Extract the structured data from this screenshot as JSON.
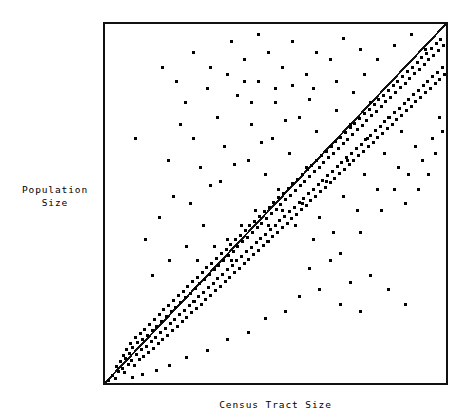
{
  "chart_data": {
    "type": "scatter",
    "title": "",
    "xlabel": "Census Tract Size",
    "ylabel": "Population\nSize",
    "grid": false,
    "legend": null,
    "axis_ticks": {
      "x": [],
      "y": []
    },
    "xlim": [
      0,
      100
    ],
    "ylim": [
      0,
      100
    ],
    "reference_line": {
      "name": "identity-line",
      "from": [
        0,
        0
      ],
      "to": [
        100,
        100
      ],
      "style": "solid",
      "color": "#111111",
      "width_px": 2
    },
    "marker": {
      "shape": "square",
      "size_px": 3,
      "color": "#000000"
    },
    "n_points": 466,
    "points": [
      [
        1.0,
        0.6
      ],
      [
        2.3,
        2.0
      ],
      [
        3.1,
        1.2
      ],
      [
        3.4,
        4.6
      ],
      [
        4.0,
        3.2
      ],
      [
        4.6,
        6.0
      ],
      [
        5.0,
        4.1
      ],
      [
        5.3,
        7.7
      ],
      [
        5.8,
        3.0
      ],
      [
        6.1,
        6.9
      ],
      [
        6.4,
        9.4
      ],
      [
        6.9,
        5.2
      ],
      [
        7.2,
        8.1
      ],
      [
        7.5,
        11.0
      ],
      [
        7.9,
        6.3
      ],
      [
        8.2,
        9.9
      ],
      [
        8.6,
        4.8
      ],
      [
        8.9,
        12.6
      ],
      [
        9.2,
        8.0
      ],
      [
        9.6,
        11.4
      ],
      [
        10.0,
        6.6
      ],
      [
        10.3,
        13.9
      ],
      [
        10.7,
        9.2
      ],
      [
        11.0,
        12.1
      ],
      [
        11.4,
        7.4
      ],
      [
        11.7,
        15.0
      ],
      [
        12.1,
        10.3
      ],
      [
        12.4,
        13.2
      ],
      [
        12.8,
        8.5
      ],
      [
        13.1,
        16.4
      ],
      [
        13.5,
        11.6
      ],
      [
        13.8,
        14.5
      ],
      [
        14.2,
        9.7
      ],
      [
        14.5,
        17.8
      ],
      [
        14.9,
        12.8
      ],
      [
        15.2,
        15.8
      ],
      [
        15.6,
        10.9
      ],
      [
        15.9,
        19.1
      ],
      [
        16.3,
        14.0
      ],
      [
        16.6,
        17.2
      ],
      [
        17.0,
        12.1
      ],
      [
        17.3,
        20.4
      ],
      [
        17.7,
        15.3
      ],
      [
        18.0,
        18.5
      ],
      [
        18.4,
        13.3
      ],
      [
        18.7,
        21.7
      ],
      [
        19.1,
        16.6
      ],
      [
        19.4,
        19.8
      ],
      [
        19.8,
        14.5
      ],
      [
        20.1,
        23.0
      ],
      [
        20.5,
        17.8
      ],
      [
        20.8,
        21.1
      ],
      [
        21.2,
        15.8
      ],
      [
        21.5,
        24.3
      ],
      [
        21.9,
        19.0
      ],
      [
        22.2,
        22.4
      ],
      [
        22.6,
        17.0
      ],
      [
        22.9,
        25.6
      ],
      [
        23.3,
        20.3
      ],
      [
        23.6,
        23.7
      ],
      [
        24.0,
        18.3
      ],
      [
        24.3,
        26.9
      ],
      [
        24.7,
        21.5
      ],
      [
        25.0,
        25.0
      ],
      [
        25.4,
        19.5
      ],
      [
        25.7,
        28.2
      ],
      [
        26.1,
        22.8
      ],
      [
        26.4,
        26.3
      ],
      [
        26.8,
        20.8
      ],
      [
        27.1,
        29.5
      ],
      [
        27.5,
        24.0
      ],
      [
        27.8,
        27.6
      ],
      [
        28.2,
        22.0
      ],
      [
        28.5,
        30.8
      ],
      [
        28.9,
        25.3
      ],
      [
        29.2,
        28.9
      ],
      [
        29.6,
        23.3
      ],
      [
        29.9,
        32.1
      ],
      [
        30.3,
        26.5
      ],
      [
        30.6,
        30.2
      ],
      [
        31.0,
        24.5
      ],
      [
        31.3,
        33.4
      ],
      [
        31.7,
        27.8
      ],
      [
        32.0,
        31.5
      ],
      [
        32.4,
        25.8
      ],
      [
        32.7,
        34.7
      ],
      [
        33.1,
        29.0
      ],
      [
        33.4,
        32.8
      ],
      [
        33.8,
        27.0
      ],
      [
        34.1,
        36.0
      ],
      [
        34.5,
        30.3
      ],
      [
        34.8,
        34.1
      ],
      [
        35.2,
        28.3
      ],
      [
        35.5,
        37.3
      ],
      [
        35.9,
        31.5
      ],
      [
        36.2,
        35.4
      ],
      [
        36.6,
        29.5
      ],
      [
        36.9,
        38.6
      ],
      [
        37.3,
        32.8
      ],
      [
        37.6,
        36.7
      ],
      [
        38.0,
        30.8
      ],
      [
        38.3,
        39.9
      ],
      [
        38.7,
        34.0
      ],
      [
        39.0,
        38.0
      ],
      [
        39.4,
        32.0
      ],
      [
        39.7,
        41.2
      ],
      [
        40.1,
        35.3
      ],
      [
        40.4,
        39.3
      ],
      [
        40.8,
        33.3
      ],
      [
        41.1,
        42.5
      ],
      [
        41.5,
        36.5
      ],
      [
        41.8,
        40.6
      ],
      [
        42.2,
        34.5
      ],
      [
        42.5,
        43.8
      ],
      [
        42.9,
        37.8
      ],
      [
        43.2,
        41.9
      ],
      [
        43.6,
        35.8
      ],
      [
        43.9,
        45.1
      ],
      [
        44.3,
        39.0
      ],
      [
        44.6,
        43.2
      ],
      [
        45.0,
        37.0
      ],
      [
        45.3,
        46.4
      ],
      [
        45.7,
        40.3
      ],
      [
        46.0,
        44.5
      ],
      [
        46.4,
        38.3
      ],
      [
        46.7,
        47.7
      ],
      [
        47.1,
        41.5
      ],
      [
        47.4,
        45.8
      ],
      [
        47.8,
        39.5
      ],
      [
        48.1,
        49.0
      ],
      [
        48.5,
        42.8
      ],
      [
        48.8,
        47.1
      ],
      [
        49.2,
        40.8
      ],
      [
        49.5,
        50.3
      ],
      [
        49.9,
        44.0
      ],
      [
        50.2,
        48.4
      ],
      [
        50.6,
        42.0
      ],
      [
        50.9,
        51.6
      ],
      [
        51.3,
        45.3
      ],
      [
        51.6,
        49.7
      ],
      [
        52.0,
        43.3
      ],
      [
        52.3,
        52.9
      ],
      [
        52.7,
        46.5
      ],
      [
        53.0,
        51.0
      ],
      [
        53.4,
        44.5
      ],
      [
        53.7,
        54.2
      ],
      [
        54.1,
        47.8
      ],
      [
        54.4,
        52.3
      ],
      [
        54.8,
        45.8
      ],
      [
        55.1,
        55.5
      ],
      [
        55.5,
        49.0
      ],
      [
        55.8,
        53.6
      ],
      [
        56.2,
        47.0
      ],
      [
        56.5,
        56.8
      ],
      [
        56.9,
        50.3
      ],
      [
        57.2,
        54.9
      ],
      [
        57.6,
        48.3
      ],
      [
        57.9,
        58.1
      ],
      [
        58.3,
        51.5
      ],
      [
        58.6,
        56.2
      ],
      [
        59.0,
        49.5
      ],
      [
        59.3,
        59.4
      ],
      [
        59.7,
        52.8
      ],
      [
        60.0,
        57.5
      ],
      [
        60.4,
        50.8
      ],
      [
        60.7,
        60.7
      ],
      [
        61.1,
        54.0
      ],
      [
        61.4,
        58.8
      ],
      [
        61.8,
        52.0
      ],
      [
        62.1,
        62.0
      ],
      [
        62.5,
        55.3
      ],
      [
        62.8,
        60.1
      ],
      [
        63.2,
        53.3
      ],
      [
        63.5,
        63.3
      ],
      [
        63.9,
        56.5
      ],
      [
        64.2,
        61.4
      ],
      [
        64.6,
        54.5
      ],
      [
        64.9,
        64.6
      ],
      [
        65.3,
        57.8
      ],
      [
        65.6,
        62.7
      ],
      [
        66.0,
        55.8
      ],
      [
        66.3,
        65.9
      ],
      [
        66.7,
        59.0
      ],
      [
        67.0,
        64.0
      ],
      [
        67.4,
        57.0
      ],
      [
        67.7,
        67.2
      ],
      [
        68.1,
        60.3
      ],
      [
        68.4,
        65.3
      ],
      [
        68.8,
        58.3
      ],
      [
        69.1,
        68.5
      ],
      [
        69.5,
        61.5
      ],
      [
        69.8,
        66.6
      ],
      [
        70.2,
        59.5
      ],
      [
        70.5,
        69.8
      ],
      [
        70.9,
        62.8
      ],
      [
        71.2,
        67.9
      ],
      [
        71.6,
        60.8
      ],
      [
        71.9,
        71.1
      ],
      [
        72.3,
        64.0
      ],
      [
        72.6,
        69.2
      ],
      [
        73.0,
        62.0
      ],
      [
        73.3,
        72.4
      ],
      [
        73.7,
        65.3
      ],
      [
        74.0,
        70.5
      ],
      [
        74.4,
        63.3
      ],
      [
        74.7,
        73.7
      ],
      [
        75.1,
        66.5
      ],
      [
        75.4,
        71.8
      ],
      [
        75.8,
        64.5
      ],
      [
        76.1,
        75.0
      ],
      [
        76.5,
        67.8
      ],
      [
        76.8,
        73.1
      ],
      [
        77.2,
        65.8
      ],
      [
        77.5,
        76.3
      ],
      [
        77.9,
        69.0
      ],
      [
        78.2,
        74.4
      ],
      [
        78.6,
        67.0
      ],
      [
        78.9,
        77.6
      ],
      [
        79.3,
        70.3
      ],
      [
        79.6,
        75.7
      ],
      [
        80.0,
        68.3
      ],
      [
        80.3,
        78.9
      ],
      [
        80.7,
        71.5
      ],
      [
        81.0,
        77.0
      ],
      [
        81.4,
        69.5
      ],
      [
        81.7,
        80.2
      ],
      [
        82.1,
        72.8
      ],
      [
        82.4,
        78.3
      ],
      [
        82.8,
        70.8
      ],
      [
        83.1,
        81.5
      ],
      [
        83.5,
        74.0
      ],
      [
        83.8,
        79.6
      ],
      [
        84.2,
        72.0
      ],
      [
        84.5,
        82.8
      ],
      [
        84.9,
        75.3
      ],
      [
        85.2,
        80.9
      ],
      [
        85.6,
        73.3
      ],
      [
        85.9,
        84.1
      ],
      [
        86.3,
        76.5
      ],
      [
        86.6,
        82.2
      ],
      [
        87.0,
        74.5
      ],
      [
        87.3,
        85.4
      ],
      [
        87.7,
        77.8
      ],
      [
        88.0,
        83.5
      ],
      [
        88.4,
        75.8
      ],
      [
        88.7,
        86.7
      ],
      [
        89.1,
        79.0
      ],
      [
        89.4,
        84.8
      ],
      [
        89.8,
        77.0
      ],
      [
        90.1,
        88.0
      ],
      [
        90.5,
        80.3
      ],
      [
        90.8,
        86.1
      ],
      [
        91.2,
        78.3
      ],
      [
        91.5,
        89.3
      ],
      [
        91.9,
        81.5
      ],
      [
        92.2,
        87.4
      ],
      [
        92.6,
        79.5
      ],
      [
        92.9,
        90.6
      ],
      [
        93.3,
        82.8
      ],
      [
        93.6,
        88.7
      ],
      [
        94.0,
        80.8
      ],
      [
        94.3,
        91.9
      ],
      [
        94.7,
        84.0
      ],
      [
        95.0,
        90.0
      ],
      [
        95.4,
        82.0
      ],
      [
        95.7,
        93.2
      ],
      [
        96.1,
        85.3
      ],
      [
        96.4,
        91.3
      ],
      [
        96.8,
        83.3
      ],
      [
        97.1,
        94.5
      ],
      [
        97.5,
        86.5
      ],
      [
        97.8,
        92.6
      ],
      [
        98.2,
        84.5
      ],
      [
        98.5,
        95.8
      ],
      [
        98.9,
        87.8
      ],
      [
        99.2,
        93.9
      ],
      [
        99.6,
        85.8
      ],
      [
        99.9,
        97.1
      ]
    ],
    "points_upper_scatter": [
      [
        22.0,
        72.0
      ],
      [
        23.5,
        78.0
      ],
      [
        30.0,
        82.0
      ],
      [
        36.0,
        86.0
      ],
      [
        41.0,
        90.0
      ],
      [
        18.5,
        62.0
      ],
      [
        26.0,
        68.0
      ],
      [
        33.0,
        74.0
      ],
      [
        39.0,
        80.0
      ],
      [
        45.0,
        84.0
      ],
      [
        28.0,
        60.0
      ],
      [
        35.0,
        66.0
      ],
      [
        43.0,
        72.0
      ],
      [
        50.0,
        78.0
      ],
      [
        55.0,
        83.0
      ],
      [
        31.0,
        55.0
      ],
      [
        38.0,
        61.0
      ],
      [
        46.0,
        67.0
      ],
      [
        53.0,
        73.0
      ],
      [
        60.0,
        79.0
      ],
      [
        25.0,
        50.0
      ],
      [
        34.0,
        56.0
      ],
      [
        42.0,
        62.0
      ],
      [
        49.0,
        68.0
      ],
      [
        57.0,
        74.0
      ],
      [
        47.0,
        58.0
      ],
      [
        54.0,
        64.0
      ],
      [
        62.0,
        70.0
      ],
      [
        68.0,
        76.0
      ],
      [
        73.0,
        81.0
      ],
      [
        51.0,
        54.0
      ],
      [
        59.0,
        60.0
      ],
      [
        66.0,
        66.0
      ],
      [
        72.0,
        72.0
      ],
      [
        78.0,
        78.0
      ],
      [
        58.0,
        50.0
      ],
      [
        65.0,
        56.0
      ],
      [
        71.0,
        62.0
      ],
      [
        77.0,
        68.0
      ],
      [
        83.0,
        74.0
      ],
      [
        63.0,
        46.0
      ],
      [
        70.0,
        52.0
      ],
      [
        76.0,
        58.0
      ],
      [
        82.0,
        64.0
      ],
      [
        87.0,
        70.0
      ],
      [
        67.0,
        42.0
      ],
      [
        74.0,
        48.0
      ],
      [
        80.0,
        54.0
      ],
      [
        86.0,
        60.0
      ],
      [
        91.0,
        66.0
      ],
      [
        44.0,
        48.0
      ],
      [
        40.0,
        44.0
      ],
      [
        36.0,
        40.0
      ],
      [
        48.0,
        44.0
      ],
      [
        52.0,
        48.0
      ],
      [
        56.0,
        44.0
      ],
      [
        61.0,
        40.0
      ],
      [
        69.0,
        36.0
      ],
      [
        75.0,
        42.0
      ],
      [
        81.0,
        48.0
      ],
      [
        85.0,
        54.0
      ],
      [
        89.0,
        58.0
      ],
      [
        93.0,
        62.0
      ],
      [
        96.0,
        68.0
      ],
      [
        98.0,
        74.0
      ],
      [
        88.0,
        50.0
      ],
      [
        92.0,
        54.0
      ],
      [
        95.0,
        58.0
      ],
      [
        97.0,
        64.0
      ],
      [
        99.0,
        70.0
      ],
      [
        12.0,
        40.0
      ],
      [
        16.0,
        46.0
      ],
      [
        20.0,
        52.0
      ],
      [
        29.0,
        44.0
      ],
      [
        24.0,
        38.0
      ],
      [
        19.0,
        34.0
      ],
      [
        14.0,
        30.0
      ],
      [
        27.0,
        34.0
      ],
      [
        32.0,
        38.0
      ],
      [
        37.0,
        34.0
      ]
    ],
    "points_sparse_outliers": [
      [
        17.0,
        88.0
      ],
      [
        26.0,
        92.0
      ],
      [
        37.0,
        95.0
      ],
      [
        9.0,
        68.0
      ],
      [
        45.0,
        97.0
      ],
      [
        21.0,
        84.0
      ],
      [
        48.0,
        92.0
      ],
      [
        55.0,
        95.0
      ],
      [
        62.0,
        92.0
      ],
      [
        70.0,
        96.0
      ],
      [
        31.0,
        88.0
      ],
      [
        41.0,
        84.0
      ],
      [
        52.0,
        88.0
      ],
      [
        59.0,
        86.0
      ],
      [
        66.0,
        90.0
      ],
      [
        75.0,
        93.0
      ],
      [
        80.0,
        90.0
      ],
      [
        85.0,
        94.0
      ],
      [
        90.0,
        97.0
      ],
      [
        94.0,
        93.0
      ],
      [
        76.0,
        86.0
      ],
      [
        68.0,
        84.0
      ],
      [
        61.0,
        82.0
      ],
      [
        50.0,
        82.0
      ],
      [
        43.0,
        78.0
      ]
    ],
    "points_lower_right": [
      [
        60.0,
        32.0
      ],
      [
        66.0,
        34.0
      ],
      [
        72.0,
        28.0
      ],
      [
        78.0,
        30.0
      ],
      [
        63.0,
        26.0
      ],
      [
        69.0,
        22.0
      ],
      [
        83.0,
        26.0
      ],
      [
        75.0,
        20.0
      ],
      [
        88.0,
        22.0
      ],
      [
        57.0,
        24.0
      ],
      [
        53.0,
        20.0
      ],
      [
        47.0,
        18.0
      ],
      [
        42.0,
        14.0
      ],
      [
        36.0,
        12.0
      ],
      [
        30.0,
        9.0
      ],
      [
        24.0,
        7.0
      ],
      [
        19.0,
        5.0
      ],
      [
        15.0,
        3.5
      ],
      [
        11.0,
        2.5
      ],
      [
        8.0,
        1.5
      ]
    ]
  },
  "labels": {
    "title": "",
    "y_axis": "Population\nSize",
    "x_axis": "Census Tract Size"
  },
  "colors": {
    "background": "#ffffff",
    "frame": "#111111",
    "marker": "#000000",
    "line": "#111111",
    "text": "#000000"
  }
}
